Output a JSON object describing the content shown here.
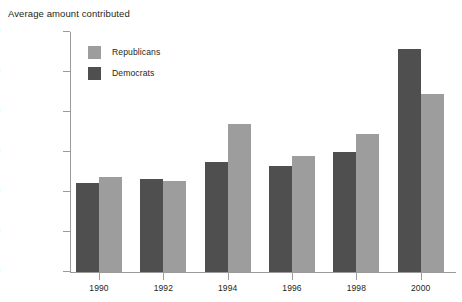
{
  "chart_data": {
    "type": "bar",
    "title": "Average amount contributed",
    "xlabel": "",
    "ylabel": "",
    "categories": [
      "1990",
      "1992",
      "1994",
      "1996",
      "1998",
      "2000"
    ],
    "series": [
      {
        "name": "Republicans",
        "color": "#9d9d9d",
        "values": [
          2370000,
          2270000,
          3700000,
          2900000,
          3450000,
          4450000
        ]
      },
      {
        "name": "Democrats",
        "color": "#4f4f4f",
        "values": [
          2220000,
          2330000,
          2750000,
          2650000,
          3000000,
          5580000
        ]
      }
    ],
    "series_draw_order": [
      "Democrats",
      "Republicans"
    ],
    "ylim": [
      0,
      6000000
    ],
    "ytick_values": [
      0,
      1000000,
      2000000,
      3000000,
      4000000,
      5000000,
      6000000
    ],
    "ytick_labels": [
      "0",
      "$1,000,000",
      "$2,000,000",
      "$3,000,000",
      "$4,000,000",
      "$5,000,000",
      "$6,000,000"
    ],
    "grid": false,
    "legend_position": "top-left-inside"
  },
  "legend": {
    "items": [
      {
        "label": "Republicans",
        "color": "#9d9d9d"
      },
      {
        "label": "Democrats",
        "color": "#4f4f4f"
      }
    ]
  },
  "colors": {
    "republicans": "#9d9d9d",
    "democrats": "#4f4f4f",
    "axis": "#9b9b9b",
    "text": "#231f20",
    "background": "#ffffff"
  }
}
